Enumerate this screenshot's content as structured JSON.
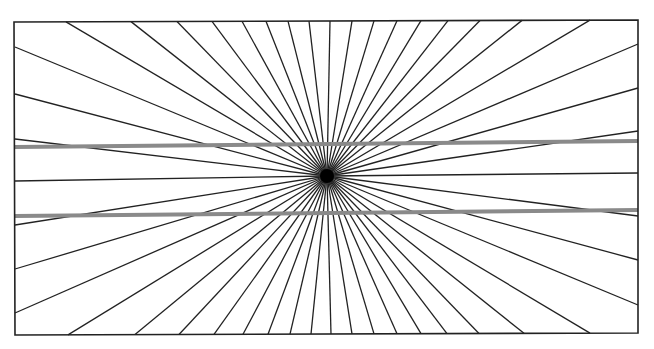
{
  "figure": {
    "name": "Hering illusion"
  },
  "frame": {
    "tl": [
      14,
      22
    ],
    "tr": [
      638,
      20
    ],
    "br": [
      638,
      333
    ],
    "bl": [
      15,
      335
    ],
    "stroke": "#222222"
  },
  "center": [
    327,
    176
  ],
  "rays": {
    "top_x": [
      66,
      131,
      177,
      212,
      242,
      266,
      288,
      309,
      330,
      352,
      374,
      397,
      421,
      448,
      480,
      522,
      590
    ],
    "bottom_x": [
      68,
      135,
      179,
      214,
      243,
      268,
      290,
      311,
      331,
      352,
      374,
      397,
      421,
      447,
      479,
      524,
      590
    ],
    "left_y": [
      47,
      94,
      139,
      181,
      225,
      269,
      313
    ],
    "right_y": [
      44,
      88,
      131,
      173,
      216,
      260,
      305
    ],
    "stroke": "#222222"
  },
  "parallel_lines": [
    {
      "from": [
        15,
        147
      ],
      "to": [
        638,
        141
      ],
      "color": "#8a8a8a",
      "width": 4
    },
    {
      "from": [
        15,
        216
      ],
      "to": [
        638,
        210
      ],
      "color": "#8a8a8a",
      "width": 4
    }
  ]
}
